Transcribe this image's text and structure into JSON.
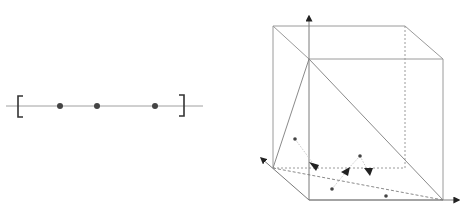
{
  "figure": {
    "background": "#ffffff",
    "line_color": "#9a9a9a",
    "ink_color": "#333333",
    "interval_panel": {
      "description": "closed interval on a number line with three sample points",
      "line": {
        "x1": 6,
        "x2": 203,
        "y": 106
      },
      "left_bracket_x": 20,
      "right_bracket_x": 182,
      "points_x": [
        60,
        97,
        155
      ]
    },
    "cube_panel": {
      "description": "unit cube with three axes, a simplex (triangle) inside, sample points with arrows projecting onto the simplex",
      "axes": [
        "up",
        "left",
        "right"
      ],
      "points": [
        {
          "x": 295,
          "y": 139
        },
        {
          "x": 360,
          "y": 156
        },
        {
          "x": 332,
          "y": 189
        },
        {
          "x": 386,
          "y": 196
        }
      ],
      "arrowheads": [
        {
          "x": 316,
          "y": 167
        },
        {
          "x": 346,
          "y": 172
        },
        {
          "x": 369,
          "y": 172
        }
      ]
    }
  }
}
